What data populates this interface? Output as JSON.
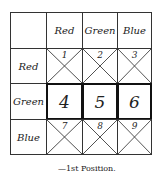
{
  "table": {
    "columns": [
      "Red",
      "Green",
      "Blue"
    ],
    "rows": [
      {
        "label": "Red",
        "cells": [
          "1",
          "2",
          "3"
        ],
        "crossed": true
      },
      {
        "label": "Green",
        "cells": [
          "4",
          "5",
          "6"
        ],
        "crossed": false
      },
      {
        "label": "Blue",
        "cells": [
          "7",
          "8",
          "9"
        ],
        "crossed": true
      }
    ]
  },
  "caption": "—1st Position."
}
